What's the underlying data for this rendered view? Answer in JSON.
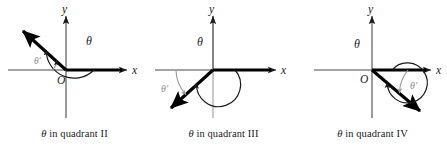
{
  "figure": {
    "background_color": "#ffffff",
    "axis_color": "#1a1a1a",
    "ray_color": "#000000",
    "arc_color": "#1a1a1a",
    "reference_arc_color": "#9a9a9a",
    "reference_label_color": "#8c8c8c",
    "axis_label_x": "x",
    "axis_label_y": "y",
    "origin_label": "O",
    "theta_label": "θ",
    "theta_prime_label": "θ′"
  },
  "panels": [
    {
      "id": "quadrant-2",
      "caption_theta": "θ",
      "caption_text": " in quadrant II",
      "caption_full": "θ in quadrant II",
      "quadrant": "II",
      "labels": {
        "x_axis": "x",
        "y_axis": "y",
        "origin": "O",
        "theta": "θ",
        "theta_prime": "θ′"
      },
      "terminal_angle_deg": 135,
      "theta_arc_sweep_deg": 135,
      "reference_angle_deg": 45
    },
    {
      "id": "quadrant-3",
      "caption_theta": "θ",
      "caption_text": " in quadrant III",
      "caption_full": "θ in quadrant III",
      "quadrant": "III",
      "labels": {
        "x_axis": "x",
        "y_axis": "y",
        "origin": "O",
        "theta": "θ",
        "theta_prime": "θ′"
      },
      "terminal_angle_deg": 222,
      "theta_arc_sweep_deg": 222,
      "reference_angle_deg": 42
    },
    {
      "id": "quadrant-4",
      "caption_theta": "θ",
      "caption_text": " in quadrant IV",
      "caption_full": "θ in quadrant IV",
      "quadrant": "IV",
      "labels": {
        "x_axis": "x",
        "y_axis": "y",
        "origin": "O",
        "theta": "θ",
        "theta_prime": "θ′"
      },
      "terminal_angle_deg": 320,
      "theta_arc_sweep_deg": 320,
      "reference_angle_deg": 40
    }
  ]
}
